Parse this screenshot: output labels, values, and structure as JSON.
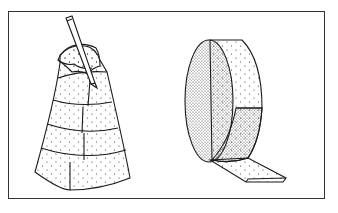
{
  "figure": {
    "frame_color": "#333333",
    "line_color": "#1a1a1a",
    "background": "#ffffff",
    "panels": [
      {
        "name": "wrapped-cone",
        "caption": ""
      },
      {
        "name": "material-roll",
        "caption": ""
      }
    ]
  }
}
